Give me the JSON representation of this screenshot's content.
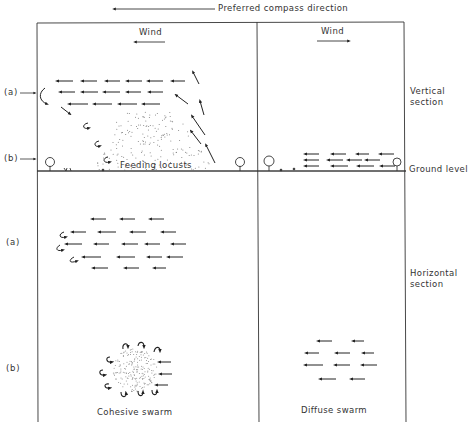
{
  "header": {
    "compass_label": "Preferred compass direction",
    "compass_arrow_direction": "left"
  },
  "columns": {
    "left": {
      "wind_label": "Wind",
      "wind_direction": "left",
      "caption": "Cohesive swarm"
    },
    "right": {
      "wind_label": "Wind",
      "wind_direction": "right",
      "caption": "Diffuse swarm"
    }
  },
  "rows": {
    "vertical": {
      "section_label_line1": "Vertical",
      "section_label_line2": "section",
      "marker_a": "(a)",
      "marker_b": "(b)",
      "annotation": "Feeding locusts",
      "ground_label": "Ground level"
    },
    "horizontal": {
      "section_label_line1": "Horizontal",
      "section_label_line2": "section",
      "marker_a": "(a)",
      "marker_b": "(b)"
    }
  },
  "colors": {
    "line": "#333333",
    "stipple": "#888888",
    "background": "#ffffff"
  }
}
